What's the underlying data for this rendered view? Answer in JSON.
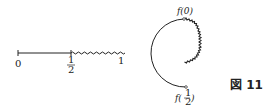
{
  "figure": {
    "caption": "図 11",
    "segment": {
      "labels": {
        "start": "0",
        "half_num": "1",
        "half_den": "2",
        "end": "1"
      }
    },
    "circle": {
      "top_label": "f(0)",
      "bottom_label_prefix": "f(",
      "bottom_label_num": "1",
      "bottom_label_den": "2",
      "bottom_label_suffix": ")"
    },
    "colors": {
      "stroke": "#222222"
    }
  }
}
